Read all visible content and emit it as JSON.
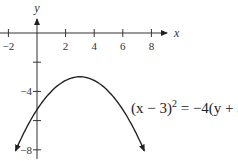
{
  "chart_data": {
    "type": "line",
    "title": "",
    "xlabel": "x",
    "ylabel": "y",
    "xlim": [
      -2.5,
      9
    ],
    "ylim": [
      -8.5,
      1.5
    ],
    "x_ticks": [
      -2,
      2,
      4,
      6,
      8
    ],
    "x_tick_labels": [
      "−2",
      "2",
      "4",
      "6",
      "8"
    ],
    "y_ticks": [
      -2,
      -4,
      -6,
      -8
    ],
    "y_tick_labels": [
      "",
      "−4",
      "",
      "−8"
    ],
    "grid": false,
    "series": [
      {
        "name": "(x−3)^2 = −4(y+3)",
        "equation": "(x-3)^2 = -4(y+3)",
        "vertex": [
          3,
          -3
        ],
        "x": [
          -1.5,
          -1,
          0,
          1,
          2,
          3,
          4,
          5,
          6,
          7,
          7.5
        ],
        "y": [
          -8.06,
          -7,
          -5.25,
          -4,
          -3.25,
          -3,
          -3.25,
          -4,
          -5.25,
          -7,
          -8.06
        ]
      }
    ],
    "annotations": [
      {
        "text": "(x − 3)² = −4(y + 3)",
        "position": "right of curve, near y=−5"
      }
    ]
  },
  "labels": {
    "x_axis": "x",
    "y_axis": "y",
    "eq_left": "(x − 3)",
    "eq_exp": "2",
    "eq_right": " = −4(y + 3)"
  }
}
